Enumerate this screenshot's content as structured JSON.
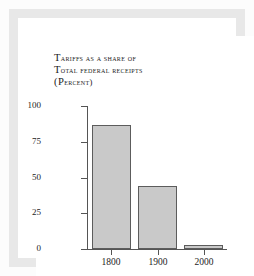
{
  "chart_data": {
    "type": "bar",
    "title": "TARIFFS AS A SHARE OF TOTAL FEDERAL RECEIPTS (PERCENT)",
    "title_lines": [
      "Tariffs as a share of",
      "Total federal receipts",
      "(percent)"
    ],
    "categories": [
      "1800",
      "1900",
      "2000"
    ],
    "values": [
      87,
      44,
      3
    ],
    "xlabel": "",
    "ylabel": "",
    "ylim": [
      0,
      100
    ],
    "yticks": [
      "100",
      "75",
      "50",
      "25",
      "0"
    ],
    "ytick_values": [
      100,
      75,
      50,
      25,
      0
    ],
    "xticks": [
      "1800",
      "1900",
      "2000"
    ],
    "grid": false,
    "legend": null,
    "colors": {
      "bar_fill": "#c9c9c9",
      "bar_edge": "#5c5c5c",
      "axis": "#555555",
      "text": "#1c1c1c",
      "plot_background": "#ffffff",
      "frame": "#e8e8e8"
    }
  }
}
